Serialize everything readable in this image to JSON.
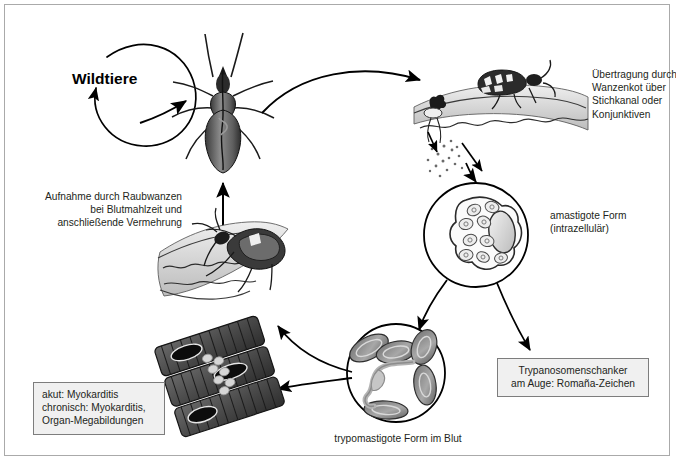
{
  "diagram": {
    "title_semantic": "Chagas disease (Trypanosoma cruzi) life cycle",
    "language": "de",
    "colors": {
      "text": "#231f20",
      "stroke": "#000000",
      "border": "#aaaaaa",
      "box_fill": "#f0f0f0",
      "box_border": "#7d7d7d",
      "body_dark": "#3b3b3b",
      "body_mid": "#8a8a8a",
      "body_light": "#d5d5d5"
    }
  },
  "labels": {
    "wildtiere": "Wildtiere",
    "aufnahme": "Aufnahme durch Raubwanzen\nbei Blutmahlzeit und\nanschließende Vermehrung",
    "uebertragung": "Übertragung durch\nWanzenkot über\nStichkanal oder\nKonjunktiven",
    "amastigote": "amastigote Form\n(intrazellulär)",
    "trypomastigote": "trypomastigote Form im Blut"
  },
  "boxes": {
    "chancre": "Trypanosomenschanker\nam Auge: Romaña-Zeichen",
    "cardiac": "akut: Myokarditis\nchronisch: Myokarditis,\nOrgan-Megabildungen"
  },
  "illustrations": {
    "triatomine_top": "triatomine-bug-dorsal",
    "bug_on_skin_defecating": "bug-on-skin-with-feces",
    "bug_feeding_on_skin": "bug-feeding-blood-meal",
    "amastigote_cell": "infected-host-cell-with-amastigotes",
    "blood_smear": "blood-with-trypomastigote-and-erythrocytes",
    "cardiac_muscle": "cardiac-muscle-fibers-with-pseudocyst",
    "wildlife_cycle_arrow": "circular-arrow-loop"
  }
}
